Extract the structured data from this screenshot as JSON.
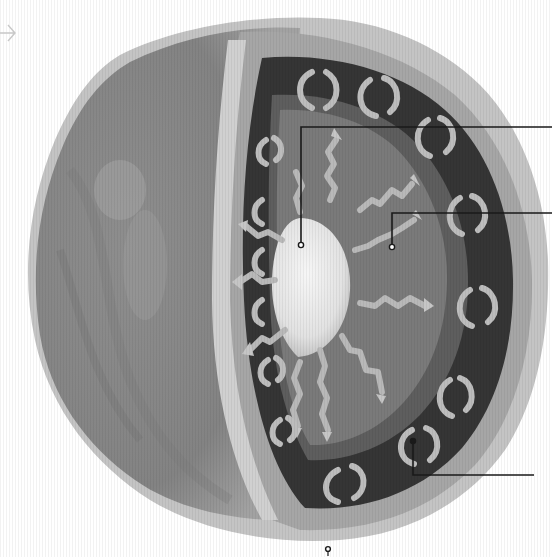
{
  "diagram": {
    "title": "",
    "colors": {
      "background": "#ffffff",
      "crust_outer": "#bdbdbd",
      "surface_shell": "#8a8a8a",
      "crust_band": "#a9a9a9",
      "mantle_ring": "#3a3a3a",
      "mantle_inner_edge": "#6e6e6e",
      "outer_core": "#777777",
      "inner_core": "#e8e8e8",
      "heat_arrows": "#b8b8b8",
      "convection_arrows": "#bcbcbc",
      "leader_line": "#1a1a1a"
    },
    "layers": [
      {
        "id": "inner-core",
        "label": ""
      },
      {
        "id": "outer-core-heat-radiation",
        "label": ""
      },
      {
        "id": "mantle-convection",
        "label": ""
      },
      {
        "id": "crust",
        "label": ""
      }
    ],
    "callouts": [
      {
        "id": "callout-inner-core",
        "anchor": [
          301,
          243
        ],
        "elbow": [
          301,
          127
        ],
        "end": [
          552,
          127
        ],
        "label": ""
      },
      {
        "id": "callout-heat-radiation",
        "anchor": [
          392,
          246
        ],
        "elbow": [
          392,
          213
        ],
        "end": [
          552,
          213
        ],
        "label": ""
      },
      {
        "id": "callout-convection",
        "anchor": [
          413,
          441
        ],
        "elbow": [
          413,
          475
        ],
        "end": [
          534,
          475
        ],
        "label": ""
      },
      {
        "id": "callout-bottom-pin",
        "anchor": [
          328,
          510
        ],
        "label": ""
      }
    ],
    "nav_arrow": {
      "icon": "arrow-right-icon",
      "glyph": "→"
    }
  }
}
